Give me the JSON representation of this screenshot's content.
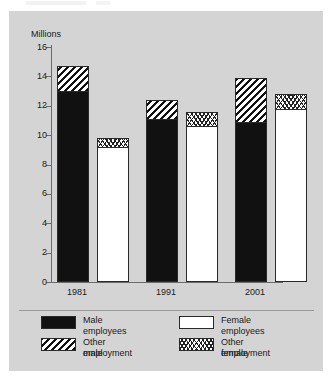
{
  "axis_title": "Millions",
  "x_categories": [
    "1981",
    "1991",
    "2001"
  ],
  "y_ticks": [
    "16",
    "14",
    "12",
    "10",
    "8",
    "6",
    "4",
    "2",
    "0"
  ],
  "legend": {
    "items": [
      {
        "key": "male-employees",
        "label": "Male employees",
        "pattern": "solid"
      },
      {
        "key": "female-employees",
        "label": "Female employees",
        "pattern": "white"
      },
      {
        "key": "other-male",
        "label": "Other male\nemployment",
        "pattern": "hatch"
      },
      {
        "key": "other-female",
        "label": "Other female\nemployment",
        "pattern": "wave"
      }
    ],
    "labels": {
      "male_employees": "Male employees",
      "female_employees": "Female employees",
      "other_male_line1": "Other male",
      "other_male_line2": "employment",
      "other_female_line1": "Other female",
      "other_female_line2": "employment"
    }
  },
  "colors": {
    "figure_background": "#d4d4d4",
    "ink": "#111111",
    "axis": "#6b6b6b",
    "bar_white": "#ffffff"
  },
  "chart_data": {
    "type": "bar",
    "title": "",
    "subtitle": "",
    "xlabel": "",
    "ylabel": "Millions",
    "ylim": [
      0,
      16
    ],
    "ytick_step": 2,
    "grid": false,
    "legend_position": "bottom",
    "stacked": true,
    "categories": [
      "1981",
      "1991",
      "2001"
    ],
    "series": [
      {
        "name": "Male employees",
        "values": [
          13.0,
          11.1,
          10.9
        ]
      },
      {
        "name": "Other male employment",
        "values": [
          1.7,
          1.3,
          3.0
        ]
      },
      {
        "name": "Female employees",
        "values": [
          9.2,
          10.6,
          11.8
        ]
      },
      {
        "name": "Other female employment",
        "values": [
          0.6,
          1.0,
          1.0
        ]
      }
    ],
    "stack_totals": {
      "male": [
        14.7,
        12.4,
        13.9
      ],
      "female": [
        9.8,
        11.6,
        12.8
      ]
    }
  }
}
